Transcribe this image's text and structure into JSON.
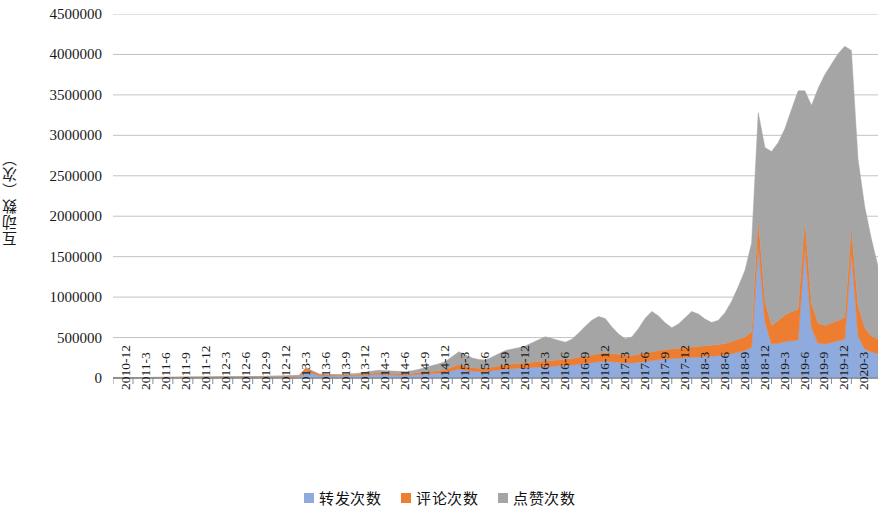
{
  "chart_data": {
    "type": "area",
    "stacked": true,
    "title": "",
    "subtitle": "",
    "xlabel": "",
    "ylabel": "互动数（次）",
    "ylim": [
      0,
      4500000
    ],
    "ytick_labels": [
      "0",
      "500000",
      "1000000",
      "1500000",
      "2000000",
      "2500000",
      "3000000",
      "3500000",
      "4000000",
      "4500000"
    ],
    "ytick_values": [
      0,
      500000,
      1000000,
      1500000,
      2000000,
      2500000,
      3000000,
      3500000,
      4000000,
      4500000
    ],
    "grid": true,
    "grid_axis": "y",
    "legend_position": "bottom",
    "x_tick_labels": [
      "2010-12",
      "2011-3",
      "2011-6",
      "2011-9",
      "2011-12",
      "2012-3",
      "2012-6",
      "2012-9",
      "2012-12",
      "2013-3",
      "2013-6",
      "2013-9",
      "2013-12",
      "2014-3",
      "2014-6",
      "2014-9",
      "2014-12",
      "2015-3",
      "2015-6",
      "2015-9",
      "2015-12",
      "2016-3",
      "2016-6",
      "2016-9",
      "2016-12",
      "2017-3",
      "2017-6",
      "2017-9",
      "2017-12",
      "2018-3",
      "2018-6",
      "2018-9",
      "2018-12",
      "2019-3",
      "2019-6",
      "2019-9",
      "2019-12",
      "2020-3"
    ],
    "x_tick_step_months": 3,
    "x_start": "2010-12",
    "x_end": "2020-3",
    "colors": {
      "转发次数": "#8FAADC",
      "评论次数": "#ED7D31",
      "点赞次数": "#A5A5A5"
    },
    "series": [
      {
        "name": "转发次数",
        "color": "#8FAADC",
        "values": [
          2000,
          2000,
          3000,
          3000,
          4000,
          4000,
          5000,
          5000,
          6000,
          6000,
          7000,
          7000,
          8000,
          8000,
          9000,
          9000,
          10000,
          10000,
          11000,
          11000,
          12000,
          12000,
          13000,
          13000,
          14000,
          15000,
          16000,
          18000,
          20000,
          80000,
          55000,
          30000,
          25000,
          24000,
          23000,
          25000,
          27000,
          30000,
          35000,
          40000,
          45000,
          42000,
          40000,
          38000,
          36000,
          40000,
          45000,
          50000,
          55000,
          60000,
          70000,
          90000,
          110000,
          95000,
          85000,
          80000,
          78000,
          90000,
          100000,
          110000,
          115000,
          120000,
          125000,
          130000,
          135000,
          140000,
          145000,
          150000,
          155000,
          160000,
          170000,
          180000,
          190000,
          200000,
          210000,
          200000,
          195000,
          190000,
          185000,
          195000,
          205000,
          215000,
          225000,
          235000,
          240000,
          245000,
          250000,
          255000,
          260000,
          265000,
          270000,
          275000,
          285000,
          300000,
          320000,
          340000,
          380000,
          1650000,
          700000,
          420000,
          430000,
          450000,
          460000,
          470000,
          1620000,
          620000,
          430000,
          420000,
          440000,
          460000,
          480000,
          1550000,
          520000,
          360000,
          320000,
          300000
        ]
      },
      {
        "name": "评论次数",
        "color": "#ED7D31",
        "values": [
          1000,
          1000,
          1000,
          1500,
          1500,
          2000,
          2000,
          2500,
          2500,
          3000,
          3000,
          3500,
          3500,
          4000,
          4000,
          4500,
          4500,
          5000,
          5000,
          5500,
          5500,
          6000,
          6000,
          6500,
          7000,
          7500,
          8000,
          9000,
          10000,
          45000,
          28000,
          15000,
          12000,
          12000,
          12000,
          13000,
          14000,
          15000,
          18000,
          20000,
          22000,
          21000,
          20000,
          19000,
          18000,
          20000,
          22000,
          25000,
          28000,
          30000,
          35000,
          45000,
          55000,
          48000,
          42000,
          40000,
          39000,
          45000,
          50000,
          55000,
          58000,
          60000,
          62000,
          65000,
          68000,
          70000,
          72000,
          75000,
          78000,
          80000,
          85000,
          90000,
          95000,
          100000,
          105000,
          100000,
          98000,
          95000,
          92000,
          98000,
          103000,
          108000,
          113000,
          118000,
          120000,
          123000,
          125000,
          128000,
          130000,
          133000,
          135000,
          138000,
          143000,
          150000,
          160000,
          170000,
          190000,
          330000,
          250000,
          230000,
          280000,
          330000,
          360000,
          380000,
          330000,
          300000,
          250000,
          230000,
          240000,
          250000,
          270000,
          300000,
          380000,
          260000,
          200000,
          180000
        ]
      },
      {
        "name": "点赞次数",
        "color": "#A5A5A5",
        "values": [
          0,
          0,
          0,
          0,
          0,
          0,
          0,
          0,
          0,
          0,
          0,
          0,
          0,
          0,
          0,
          0,
          0,
          0,
          0,
          0,
          0,
          0,
          0,
          0,
          1000,
          1000,
          2000,
          2000,
          3000,
          3000,
          3000,
          4000,
          5000,
          6000,
          8000,
          10000,
          12000,
          15000,
          20000,
          25000,
          30000,
          28000,
          26000,
          25000,
          24000,
          30000,
          40000,
          55000,
          70000,
          85000,
          100000,
          130000,
          160000,
          140000,
          120000,
          110000,
          105000,
          125000,
          150000,
          175000,
          185000,
          195000,
          210000,
          240000,
          270000,
          300000,
          270000,
          240000,
          210000,
          240000,
          300000,
          370000,
          430000,
          460000,
          420000,
          330000,
          250000,
          200000,
          230000,
          320000,
          430000,
          500000,
          430000,
          330000,
          260000,
          300000,
          370000,
          440000,
          400000,
          330000,
          280000,
          300000,
          380000,
          500000,
          650000,
          820000,
          1100000,
          1300000,
          1900000,
          2150000,
          2200000,
          2300000,
          2500000,
          2700000,
          1600000,
          2450000,
          2900000,
          3100000,
          3200000,
          3300000,
          3350000,
          2200000,
          1800000,
          1500000,
          1200000,
          900000
        ]
      }
    ]
  },
  "legend": {
    "items": [
      {
        "label": "转发次数",
        "color": "#8FAADC"
      },
      {
        "label": "评论次数",
        "color": "#ED7D31"
      },
      {
        "label": "点赞次数",
        "color": "#A5A5A5"
      }
    ]
  },
  "axis": {
    "y_title": "互动数（次）"
  }
}
